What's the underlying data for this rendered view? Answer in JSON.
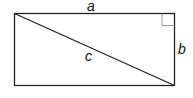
{
  "diagram": {
    "type": "rectangle-with-diagonal",
    "labels": {
      "top_side": "a",
      "right_side": "b",
      "diagonal": "c"
    },
    "right_angle_marker": "top-right corner",
    "colors": {
      "stroke": "#222222",
      "marker": "#999999",
      "background": "#ffffff"
    }
  }
}
